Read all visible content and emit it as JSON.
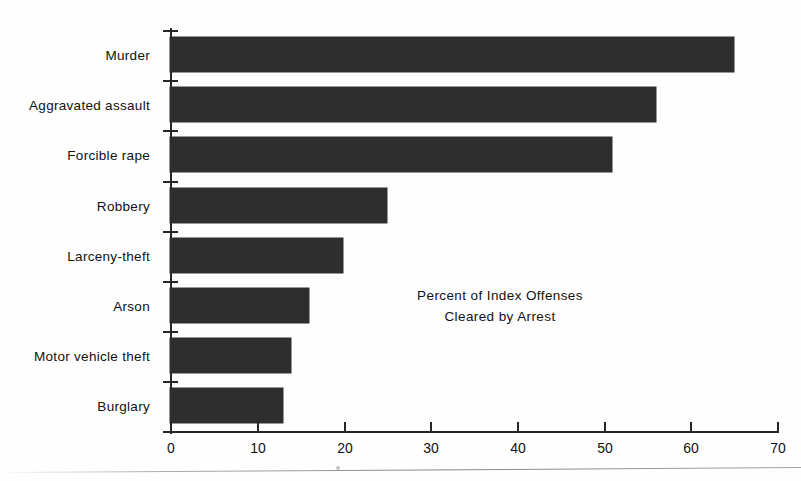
{
  "chart_data": {
    "type": "bar",
    "orientation": "horizontal",
    "title": "",
    "annotation_lines": [
      "Percent of  Index Offenses",
      "Cleared by Arrest"
    ],
    "categories": [
      "Murder",
      "Aggravated assault",
      "Forcible rape",
      "Robbery",
      "Larceny-theft",
      "Arson",
      "Motor vehicle theft",
      "Burglary"
    ],
    "values": [
      65,
      56,
      51,
      25,
      20,
      16,
      14,
      13
    ],
    "xlabel": "",
    "ylabel": "",
    "xlim": [
      0,
      70
    ],
    "xticks": [
      0,
      10,
      20,
      30,
      40,
      50,
      60,
      70
    ],
    "xtick_labels": [
      "0",
      "10",
      "20",
      "30",
      "40",
      "50",
      "60",
      "70"
    ],
    "grid": false,
    "legend": false,
    "bar_color": "#2e2e2e",
    "axis_color": "#262626",
    "background_color": "#fefefe"
  }
}
